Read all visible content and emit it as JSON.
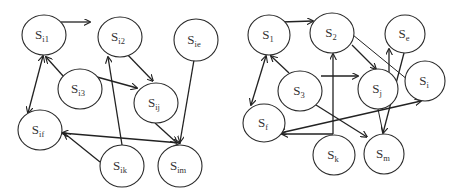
{
  "diagrams": [
    {
      "name": "left-graph",
      "nodes": [
        {
          "id": "i1",
          "label": "S",
          "sub": "i1",
          "cx": 44,
          "cy": 35,
          "rx": 22,
          "ry": 20
        },
        {
          "id": "i2",
          "label": "S",
          "sub": "i2",
          "cx": 120,
          "cy": 37,
          "rx": 22,
          "ry": 20
        },
        {
          "id": "ie",
          "label": "S",
          "sub": "ie",
          "cx": 196,
          "cy": 40,
          "rx": 22,
          "ry": 21
        },
        {
          "id": "i3",
          "label": "S",
          "sub": "i3",
          "cx": 80,
          "cy": 89,
          "rx": 22,
          "ry": 20
        },
        {
          "id": "ij",
          "label": "S",
          "sub": "ij",
          "cx": 156,
          "cy": 103,
          "rx": 22,
          "ry": 20
        },
        {
          "id": "if",
          "label": "S",
          "sub": "if",
          "cx": 40,
          "cy": 130,
          "rx": 22,
          "ry": 20
        },
        {
          "id": "ik",
          "label": "S",
          "sub": "ik",
          "cx": 122,
          "cy": 166,
          "rx": 22,
          "ry": 21
        },
        {
          "id": "im",
          "label": "S",
          "sub": "im",
          "cx": 180,
          "cy": 166,
          "rx": 22,
          "ry": 21
        }
      ],
      "edges": [
        {
          "from": [
            61,
            22
          ],
          "to": [
            90,
            22
          ],
          "start_arrow": false,
          "end_arrow": true
        },
        {
          "from": [
            123,
            50
          ],
          "to": [
            153,
            81
          ],
          "start_arrow": false,
          "end_arrow": true
        },
        {
          "from": [
            97,
            77
          ],
          "to": [
            137,
            88
          ],
          "start_arrow": false,
          "end_arrow": true
        },
        {
          "from": [
            64,
            77
          ],
          "to": [
            46,
            57
          ],
          "start_arrow": false,
          "end_arrow": true
        },
        {
          "from": [
            43,
            56
          ],
          "to": [
            28,
            113
          ],
          "start_arrow": true,
          "end_arrow": true
        },
        {
          "from": [
            122,
            145
          ],
          "to": [
            108,
            57
          ],
          "start_arrow": false,
          "end_arrow": true
        },
        {
          "from": [
            100,
            162
          ],
          "to": [
            64,
            133
          ],
          "start_arrow": false,
          "end_arrow": true
        },
        {
          "from": [
            62,
            133
          ],
          "to": [
            180,
            143
          ],
          "start_arrow": true,
          "end_arrow": true
        },
        {
          "from": [
            155,
            123
          ],
          "to": [
            177,
            143
          ],
          "start_arrow": false,
          "end_arrow": true
        },
        {
          "from": [
            194,
            60
          ],
          "to": [
            180,
            142
          ],
          "start_arrow": false,
          "end_arrow": true
        }
      ]
    },
    {
      "name": "right-graph",
      "nodes": [
        {
          "id": "1",
          "label": "S",
          "sub": "1",
          "cx": 269,
          "cy": 35,
          "rx": 21,
          "ry": 20
        },
        {
          "id": "2",
          "label": "S",
          "sub": "2",
          "cx": 332,
          "cy": 33,
          "rx": 22,
          "ry": 20
        },
        {
          "id": "e",
          "label": "S",
          "sub": "e",
          "cx": 405,
          "cy": 34,
          "rx": 20,
          "ry": 19
        },
        {
          "id": "3",
          "label": "S",
          "sub": "3",
          "cx": 300,
          "cy": 91,
          "rx": 22,
          "ry": 20
        },
        {
          "id": "j",
          "label": "S",
          "sub": "j",
          "cx": 378,
          "cy": 89,
          "rx": 20,
          "ry": 20
        },
        {
          "id": "i",
          "label": "S",
          "sub": "i",
          "cx": 425,
          "cy": 81,
          "rx": 20,
          "ry": 20
        },
        {
          "id": "f",
          "label": "S",
          "sub": "f",
          "cx": 264,
          "cy": 123,
          "rx": 21,
          "ry": 19
        },
        {
          "id": "k",
          "label": "S",
          "sub": "k",
          "cx": 334,
          "cy": 155,
          "rx": 21,
          "ry": 20
        },
        {
          "id": "m",
          "label": "S",
          "sub": "m",
          "cx": 384,
          "cy": 154,
          "rx": 20,
          "ry": 20
        }
      ],
      "edges": [
        {
          "from": [
            281,
            22
          ],
          "to": [
            313,
            21
          ],
          "start_arrow": false,
          "end_arrow": true
        },
        {
          "from": [
            352,
            45
          ],
          "to": [
            376,
            69
          ],
          "start_arrow": false,
          "end_arrow": true
        },
        {
          "from": [
            353,
            35
          ],
          "to": [
            408,
            80
          ],
          "start_arrow": false,
          "end_arrow": false
        },
        {
          "from": [
            289,
            73
          ],
          "to": [
            271,
            56
          ],
          "start_arrow": false,
          "end_arrow": true
        },
        {
          "from": [
            266,
            56
          ],
          "to": [
            251,
            105
          ],
          "start_arrow": true,
          "end_arrow": true
        },
        {
          "from": [
            321,
            76
          ],
          "to": [
            358,
            76
          ],
          "start_arrow": false,
          "end_arrow": true
        },
        {
          "from": [
            316,
            105
          ],
          "to": [
            367,
            137
          ],
          "start_arrow": false,
          "end_arrow": true
        },
        {
          "from": [
            333,
            134
          ],
          "to": [
            333,
            54
          ],
          "start_arrow": false,
          "end_arrow": true
        },
        {
          "from": [
            333,
            134
          ],
          "to": [
            282,
            134
          ],
          "start_arrow": false,
          "end_arrow": true
        },
        {
          "from": [
            280,
            133
          ],
          "to": [
            421,
            101
          ],
          "start_arrow": true,
          "end_arrow": true
        },
        {
          "from": [
            389,
            77
          ],
          "to": [
            389,
            49
          ],
          "start_arrow": false,
          "end_arrow": true
        },
        {
          "from": [
            404,
            53
          ],
          "to": [
            383,
            133
          ],
          "start_arrow": false,
          "end_arrow": true
        },
        {
          "from": [
            378,
            109
          ],
          "to": [
            383,
            133
          ],
          "start_arrow": false,
          "end_arrow": false
        }
      ]
    }
  ]
}
